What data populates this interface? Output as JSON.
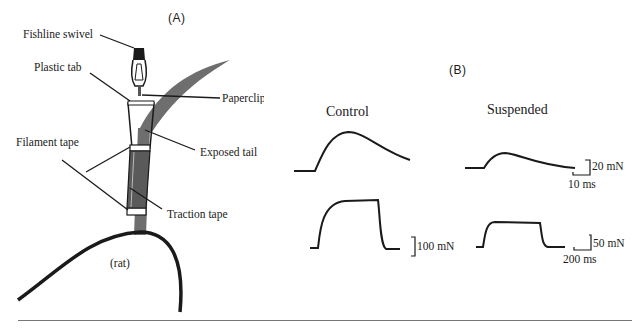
{
  "panel_a": {
    "label": "(A)",
    "callouts": {
      "fishline_swivel": "Fishline swivel",
      "plastic_tab": "Plastic tab",
      "paperclip": "Paperclip",
      "filament_tape": "Filament tape",
      "exposed_tail": "Exposed tail",
      "traction_tape": "Traction tape",
      "rat": "(rat)"
    }
  },
  "panel_b": {
    "label": "(B)",
    "conditions": [
      "Control",
      "Suspended"
    ],
    "scale_bars": {
      "twitch_force": "20 mN",
      "twitch_time": "10 ms",
      "tetanus_control_force": "100 mN",
      "tetanus_suspended_force": "50 mN",
      "tetanus_time": "200 ms"
    }
  },
  "colors": {
    "ink": "#1a1a1a",
    "tail_gray": "#6e6e6e",
    "rule": "#777777"
  }
}
